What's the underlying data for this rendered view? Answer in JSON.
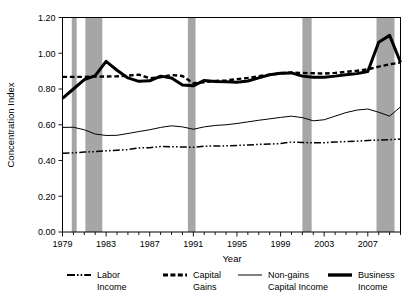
{
  "chart_data": {
    "type": "line",
    "title": "",
    "xlabel": "Year",
    "ylabel": "Concentration Index",
    "xlim": [
      1979,
      2010
    ],
    "ylim": [
      0.0,
      1.2
    ],
    "ytick_labels": [
      "0.00",
      "0.20",
      "0.40",
      "0.60",
      "0.80",
      "1.00",
      "1.20"
    ],
    "ytick_values": [
      0.0,
      0.2,
      0.4,
      0.6,
      0.8,
      1.0,
      1.2
    ],
    "xtick_labels": [
      "1979",
      "1983",
      "1987",
      "1991",
      "1995",
      "1999",
      "2003",
      "2007"
    ],
    "xtick_values": [
      1979,
      1983,
      1987,
      1991,
      1995,
      1999,
      2003,
      2007
    ],
    "minor_xticks_every": 1,
    "grid": false,
    "legend_position": "below",
    "x": [
      1979,
      1980,
      1981,
      1982,
      1983,
      1984,
      1985,
      1986,
      1987,
      1988,
      1989,
      1990,
      1991,
      1992,
      1993,
      1994,
      1995,
      1996,
      1997,
      1998,
      1999,
      2000,
      2001,
      2002,
      2003,
      2004,
      2005,
      2006,
      2007,
      2008,
      2009,
      2010
    ],
    "series": [
      {
        "name": "Labor Income",
        "style": "dashdot",
        "width": 1.5,
        "color": "#000000",
        "values": [
          0.44,
          0.443,
          0.447,
          0.45,
          0.454,
          0.458,
          0.461,
          0.47,
          0.472,
          0.478,
          0.477,
          0.476,
          0.474,
          0.48,
          0.481,
          0.482,
          0.484,
          0.487,
          0.49,
          0.492,
          0.495,
          0.503,
          0.501,
          0.499,
          0.5,
          0.503,
          0.506,
          0.508,
          0.512,
          0.514,
          0.516,
          0.52
        ]
      },
      {
        "name": "Capital Gains",
        "style": "dashed",
        "width": 2.4,
        "color": "#000000",
        "values": [
          0.868,
          0.868,
          0.868,
          0.869,
          0.87,
          0.871,
          0.875,
          0.88,
          0.86,
          0.866,
          0.878,
          0.873,
          0.832,
          0.838,
          0.845,
          0.848,
          0.855,
          0.862,
          0.872,
          0.88,
          0.888,
          0.892,
          0.89,
          0.888,
          0.886,
          0.89,
          0.896,
          0.902,
          0.91,
          0.925,
          0.938,
          0.948
        ]
      },
      {
        "name": "Non-gains Capital Income",
        "style": "solid",
        "width": 1.0,
        "color": "#000000",
        "values": [
          0.585,
          0.586,
          0.572,
          0.548,
          0.54,
          0.541,
          0.551,
          0.562,
          0.572,
          0.585,
          0.594,
          0.588,
          0.575,
          0.588,
          0.596,
          0.6,
          0.607,
          0.616,
          0.625,
          0.633,
          0.641,
          0.648,
          0.64,
          0.622,
          0.628,
          0.648,
          0.668,
          0.682,
          0.688,
          0.67,
          0.648,
          0.7
        ]
      },
      {
        "name": "Business Income",
        "style": "solid",
        "width": 3.0,
        "color": "#000000",
        "values": [
          0.748,
          0.8,
          0.852,
          0.875,
          0.955,
          0.905,
          0.862,
          0.843,
          0.846,
          0.872,
          0.862,
          0.823,
          0.818,
          0.848,
          0.842,
          0.841,
          0.838,
          0.845,
          0.862,
          0.88,
          0.888,
          0.89,
          0.872,
          0.866,
          0.866,
          0.872,
          0.88,
          0.886,
          0.898,
          1.062,
          1.1,
          0.95
        ]
      }
    ],
    "recession_bands": [
      {
        "start": 1979.85,
        "end": 1980.3
      },
      {
        "start": 1981.1,
        "end": 1982.65
      },
      {
        "start": 1990.5,
        "end": 1991.2
      },
      {
        "start": 2001.0,
        "end": 2001.85
      },
      {
        "start": 2007.8,
        "end": 2009.45
      }
    ],
    "band_color": "#a6a6a6"
  },
  "legend": {
    "items": [
      {
        "label_line1": "Labor",
        "label_line2": "Income",
        "marker": "dashdot"
      },
      {
        "label_line1": "Capital",
        "label_line2": "Gains",
        "marker": "dashed"
      },
      {
        "label_line1": "Non-gains",
        "label_line2": "Capital Income",
        "marker": "thin-solid"
      },
      {
        "label_line1": "Business",
        "label_line2": "Income",
        "marker": "thick-solid"
      }
    ]
  }
}
